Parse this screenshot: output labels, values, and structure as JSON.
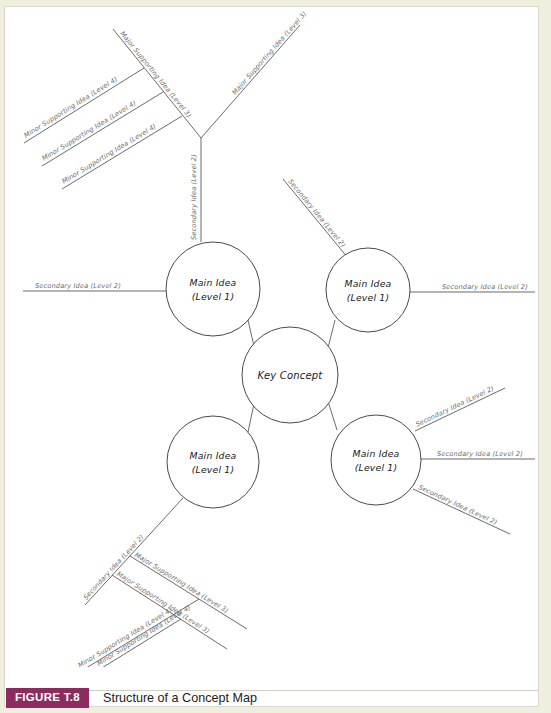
{
  "figure": {
    "badge": "FIGURE T.8",
    "title": "Structure of a Concept Map",
    "badge_color": "#8c2c5e",
    "badge_text_color": "#ffffff",
    "title_color": "#1c1c1c"
  },
  "page": {
    "background": "#ffffff",
    "margin_color": "#efeedf",
    "line_color": "#5a5a5a",
    "label_color": "#6d6d6d",
    "node_text_color": "#1a1a1a"
  },
  "diagram": {
    "type": "concept-map",
    "center": {
      "label": "Key Concept",
      "cx": 285,
      "cy": 368,
      "r": 48
    },
    "main_ideas": [
      {
        "id": "top-left",
        "line1": "Main Idea",
        "line2": "(Level 1)",
        "cx": 208,
        "cy": 282,
        "r": 47
      },
      {
        "id": "top-right",
        "line1": "Main Idea",
        "line2": "(Level 1)",
        "cx": 363,
        "cy": 283,
        "r": 42
      },
      {
        "id": "bottom-left",
        "line1": "Main Idea",
        "line2": "(Level 1)",
        "cx": 208,
        "cy": 455,
        "r": 46
      },
      {
        "id": "bottom-right",
        "line1": "Main Idea",
        "line2": "(Level 1)",
        "cx": 371,
        "cy": 453,
        "r": 45
      }
    ],
    "labels": {
      "secondary": "Secondary Idea (Level 2)",
      "major": "Major Supporting Idea (Level 3)",
      "minor": "Minor Supporting Idea (Level 4)"
    },
    "edges": [
      {
        "name": "center-to-top-left",
        "label": null
      },
      {
        "name": "center-to-top-right",
        "label": null
      },
      {
        "name": "center-to-bottom-left",
        "label": null
      },
      {
        "name": "center-to-bottom-right",
        "label": null
      },
      {
        "name": "top-left-up-trunk",
        "label": "Secondary Idea (Level 2)"
      },
      {
        "name": "top-left-major-branch",
        "label": "Major Supporting Idea (Level 3)"
      },
      {
        "name": "top-left-minor-1",
        "label": "Minor Supporting Idea (Level 4)"
      },
      {
        "name": "top-left-minor-2",
        "label": "Minor Supporting Idea (Level 4)"
      },
      {
        "name": "top-left-minor-3",
        "label": "Minor Supporting Idea (Level 4)"
      },
      {
        "name": "top-left-west",
        "label": "Secondary Idea (Level 2)"
      },
      {
        "name": "top-right-major-up",
        "label": "Major Supporting Idea (Level 3)"
      },
      {
        "name": "top-right-diagonal",
        "label": "Secondary Idea (Level 2)"
      },
      {
        "name": "top-right-east",
        "label": "Secondary Idea (Level 2)"
      },
      {
        "name": "bottom-left-secondary",
        "label": "Secondary Idea (Level 2)"
      },
      {
        "name": "bottom-left-major-1",
        "label": "Major Supporting Idea (Level 3)"
      },
      {
        "name": "bottom-left-major-2",
        "label": "Major Supporting Idea (Level 3)"
      },
      {
        "name": "bottom-left-minor-1",
        "label": "Minor Supporting Idea (Level 4)"
      },
      {
        "name": "bottom-left-minor-2",
        "label": "Minor Supporting Idea (Level 4)"
      },
      {
        "name": "bottom-right-ne",
        "label": "Secondary Idea (Level 2)"
      },
      {
        "name": "bottom-right-east",
        "label": "Secondary Idea (Level 2)"
      },
      {
        "name": "bottom-right-se",
        "label": "Secondary Idea (Level 2)"
      }
    ]
  }
}
